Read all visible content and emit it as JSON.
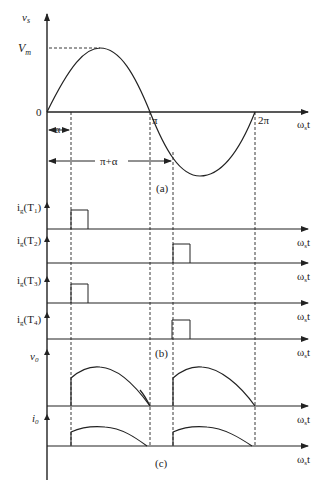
{
  "figure": {
    "part_a": {
      "y_label": "v",
      "y_label_sub": "s",
      "peak_label": "V",
      "peak_label_sub": "m",
      "origin_label": "0",
      "pi_label": "π",
      "two_pi_label": "2π",
      "alpha_label": "α",
      "pi_plus_alpha_label": "π+α",
      "x_label": "ω",
      "x_label_sub": "s",
      "x_label_t": "t",
      "caption": "(a)"
    },
    "part_b": {
      "signals": [
        {
          "label": "i",
          "sub": "g",
          "device": "(T",
          "device_sub": "1",
          "close": ")"
        },
        {
          "label": "i",
          "sub": "g",
          "device": "(T",
          "device_sub": "2",
          "close": ")"
        },
        {
          "label": "i",
          "sub": "g",
          "device": "(T",
          "device_sub": "3",
          "close": ")"
        },
        {
          "label": "i",
          "sub": "g",
          "device": "(T",
          "device_sub": "4",
          "close": ")"
        }
      ],
      "x_label": "ω",
      "x_label_sub": "s",
      "x_label_t": "t",
      "caption": "(b)"
    },
    "part_c": {
      "vo_label": "v",
      "vo_sub": "0",
      "io_label": "i",
      "io_sub": "0",
      "x_label": "ω",
      "x_label_sub": "s",
      "x_label_t": "t",
      "caption": "(c)"
    }
  }
}
